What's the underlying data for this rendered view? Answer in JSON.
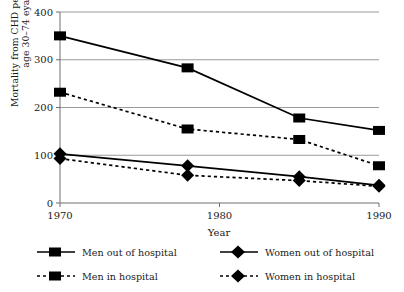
{
  "chart_data": {
    "type": "line",
    "title": "",
    "xlabel": "Year",
    "ylabel": "Mortality from CHD per 100,000\nage 30–74 eyars",
    "x": [
      1970,
      1978,
      1985,
      1990
    ],
    "xlim": [
      1970,
      1990
    ],
    "ylim": [
      0,
      400
    ],
    "xticks": [
      "1970",
      "1980",
      "1990"
    ],
    "xtick_values": [
      1970,
      1980,
      1990
    ],
    "yticks": [
      "0",
      "100",
      "200",
      "300",
      "400"
    ],
    "ytick_values": [
      0,
      100,
      200,
      300,
      400
    ],
    "grid": "horizontal",
    "legend_position": "below",
    "series": [
      {
        "name": "Men out of hospital",
        "marker": "square",
        "line": "solid",
        "color": "#000000",
        "values": [
          350,
          283,
          178,
          152
        ]
      },
      {
        "name": "Men in hospital",
        "marker": "square",
        "line": "dotted",
        "color": "#000000",
        "values": [
          232,
          155,
          133,
          78
        ]
      },
      {
        "name": "Women out of hospital",
        "marker": "diamond",
        "line": "solid",
        "color": "#000000",
        "values": [
          103,
          78,
          55,
          37
        ]
      },
      {
        "name": "Women in hospital",
        "marker": "diamond",
        "line": "dotted",
        "color": "#000000",
        "values": [
          93,
          58,
          47,
          35
        ]
      }
    ]
  },
  "axes": {
    "y_label_line1": "Mortality from CHD per 100,000",
    "y_label_line2": "age 30–74 eyars",
    "x_label": "Year"
  },
  "ticks": {
    "y": [
      "400",
      "300",
      "200",
      "100",
      "0"
    ],
    "x": [
      "1970",
      "1980",
      "1990"
    ]
  },
  "legend": {
    "items": [
      {
        "label": "Men out of hospital",
        "marker": "square",
        "line": "solid"
      },
      {
        "label": "Men in hospital",
        "marker": "square",
        "line": "dotted"
      },
      {
        "label": "Women out of hospital",
        "marker": "diamond",
        "line": "solid"
      },
      {
        "label": "Women in hospital",
        "marker": "diamond",
        "line": "dotted"
      }
    ]
  },
  "colors": {
    "ink": "#1a1a1a",
    "series": "#000000",
    "grid": "#9a9a9a",
    "axis": "#6f6f6f"
  }
}
